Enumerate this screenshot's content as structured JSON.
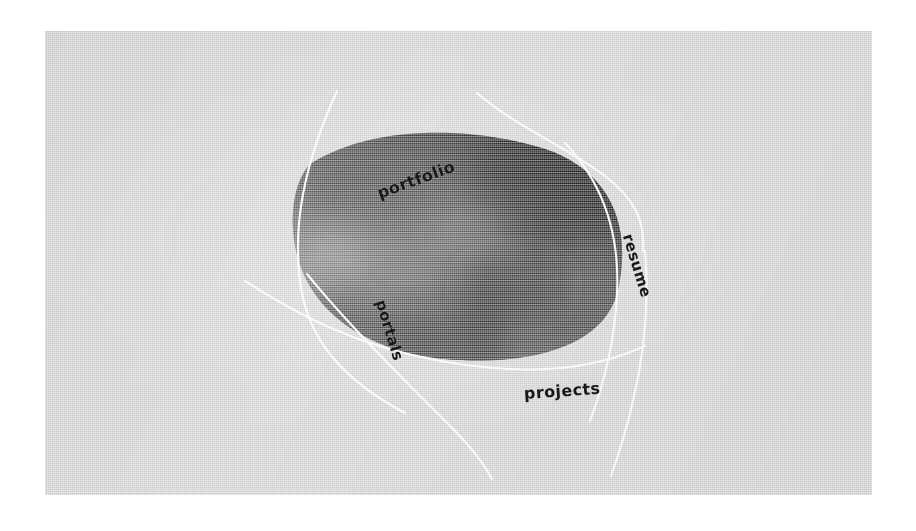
{
  "page": {
    "background_color": "#ffffff",
    "canvas_color": "#d9d9d9",
    "arc_color": "#ffffff",
    "label_color": "#181818"
  },
  "artwork": {
    "name": "curved-quad-photo-panel",
    "description": "blurred dark scanline-textured photograph clipped to a four-sided curved panel formed by four intersecting white arcs",
    "fill_dark": "#101010",
    "fill_mid": "#6a6a6a",
    "texture": "horizontal scanlines"
  },
  "nav": {
    "items": [
      {
        "id": "portfolio",
        "label": "portfolio",
        "position": "top",
        "rotation_deg": -20
      },
      {
        "id": "resume",
        "label": "resume",
        "position": "right",
        "rotation_deg": 73
      },
      {
        "id": "portals",
        "label": "portals",
        "position": "left",
        "rotation_deg": 73
      },
      {
        "id": "projects",
        "label": "projects",
        "position": "bottom",
        "rotation_deg": -4
      }
    ]
  }
}
